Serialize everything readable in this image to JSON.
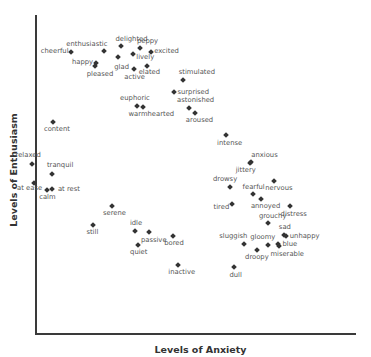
{
  "chart_data": {
    "type": "scatter",
    "title": "",
    "xlabel": "Levels of Anxiety",
    "ylabel": "Levels of Enthusiasm",
    "xlim": [
      0,
      100
    ],
    "ylim": [
      0,
      100
    ],
    "grid": false,
    "legend": null,
    "tick_labels": {
      "x": [],
      "y": []
    },
    "marker": {
      "shape": "diamond",
      "color": "#333333"
    },
    "label_color": "#555555",
    "points": [
      {
        "label": "delighted",
        "x": 26.5,
        "y": 90.2,
        "lx": -5,
        "ly": -10
      },
      {
        "label": "peppy",
        "x": 32.6,
        "y": 89.5,
        "lx": -3,
        "ly": -10
      },
      {
        "label": "enthusiastic",
        "x": 21.4,
        "y": 88.7,
        "lx": -38,
        "ly": -10
      },
      {
        "label": "cheerful",
        "x": 10.9,
        "y": 88.4,
        "lx": -30,
        "ly": -4
      },
      {
        "label": "excited",
        "x": 36.1,
        "y": 88.4,
        "lx": 3,
        "ly": -4
      },
      {
        "label": "lively",
        "x": 30.5,
        "y": 87.8,
        "lx": 3,
        "ly": 0
      },
      {
        "label": "glad",
        "x": 25.8,
        "y": 86.9,
        "lx": -4,
        "ly": 7
      },
      {
        "label": "happy",
        "x": 18.8,
        "y": 84.9,
        "lx": -24,
        "ly": -4
      },
      {
        "label": "pleased",
        "x": 18.4,
        "y": 83.9,
        "lx": -8,
        "ly": 5
      },
      {
        "label": "active",
        "x": 30.8,
        "y": 83.1,
        "lx": -10,
        "ly": 5
      },
      {
        "label": "elated",
        "x": 34.7,
        "y": 84.0,
        "lx": -8,
        "ly": 3
      },
      {
        "label": "stimulated",
        "x": 46.0,
        "y": 79.5,
        "lx": -4,
        "ly": -11
      },
      {
        "label": "surprised",
        "x": 43.4,
        "y": 75.8,
        "lx": 3,
        "ly": -3
      },
      {
        "label": "euphoric",
        "x": 31.7,
        "y": 71.5,
        "lx": -17,
        "ly": -11
      },
      {
        "label": "warmhearted",
        "x": 33.4,
        "y": 71.3,
        "lx": -14,
        "ly": 4
      },
      {
        "label": "astonished",
        "x": 48.0,
        "y": 70.8,
        "lx": -12,
        "ly": -11
      },
      {
        "label": "aroused",
        "x": 49.8,
        "y": 69.4,
        "lx": -9,
        "ly": 4
      },
      {
        "label": "content",
        "x": 5.3,
        "y": 66.6,
        "lx": -9,
        "ly": 4
      },
      {
        "label": "intense",
        "x": 59.6,
        "y": 62.5,
        "lx": -9,
        "ly": 5
      },
      {
        "label": "relaxed",
        "x": -1.4,
        "y": 53.4,
        "lx": -16,
        "ly": -12
      },
      {
        "label": "anxious",
        "x": 67.5,
        "y": 53.8,
        "lx": 0,
        "ly": -10
      },
      {
        "label": "jittery",
        "x": 67.0,
        "y": 53.6,
        "lx": -14,
        "ly": 4
      },
      {
        "label": "tranquil",
        "x": 5.0,
        "y": 50.2,
        "lx": -5,
        "ly": -12
      },
      {
        "label": "nervous",
        "x": 74.7,
        "y": 48.0,
        "lx": -9,
        "ly": 4
      },
      {
        "label": "at ease",
        "x": -0.6,
        "y": 47.3,
        "lx": -17,
        "ly": 2
      },
      {
        "label": "drowsy",
        "x": 60.8,
        "y": 46.0,
        "lx": -17,
        "ly": -11
      },
      {
        "label": "at rest",
        "x": 5.0,
        "y": 45.3,
        "lx": 6,
        "ly": -3
      },
      {
        "label": "calm",
        "x": 3.5,
        "y": 45.2,
        "lx": -8,
        "ly": 4
      },
      {
        "label": "fearful",
        "x": 67.9,
        "y": 43.9,
        "lx": -10,
        "ly": -10
      },
      {
        "label": "annoyed",
        "x": 70.5,
        "y": 42.4,
        "lx": -10,
        "ly": 4
      },
      {
        "label": "tired",
        "x": 61.3,
        "y": 40.9,
        "lx": -18,
        "ly": 0
      },
      {
        "label": "distress",
        "x": 79.5,
        "y": 40.1,
        "lx": -9,
        "ly": 5
      },
      {
        "label": "serene",
        "x": 23.8,
        "y": 40.1,
        "lx": -9,
        "ly": 4
      },
      {
        "label": "grouchy",
        "x": 72.7,
        "y": 34.9,
        "lx": -9,
        "ly": -10
      },
      {
        "label": "still",
        "x": 18.0,
        "y": 34.2,
        "lx": -7,
        "ly": 4
      },
      {
        "label": "idle",
        "x": 31.0,
        "y": 32.2,
        "lx": -5,
        "ly": -11
      },
      {
        "label": "passive",
        "x": 35.4,
        "y": 32.1,
        "lx": -8,
        "ly": 5
      },
      {
        "label": "sad",
        "x": 77.7,
        "y": 31.0,
        "lx": -5,
        "ly": -11
      },
      {
        "label": "unhappy",
        "x": 78.3,
        "y": 30.6,
        "lx": 4,
        "ly": -3
      },
      {
        "label": "bored",
        "x": 43.0,
        "y": 30.7,
        "lx": -9,
        "ly": 4
      },
      {
        "label": "sluggish",
        "x": 65.3,
        "y": 28.3,
        "lx": -25,
        "ly": -11
      },
      {
        "label": "gloomy",
        "x": 72.8,
        "y": 28.0,
        "lx": -18,
        "ly": -11
      },
      {
        "label": "blue",
        "x": 76.0,
        "y": 28.2,
        "lx": 4,
        "ly": -3
      },
      {
        "label": "miserable",
        "x": 76.3,
        "y": 27.6,
        "lx": -9,
        "ly": 5
      },
      {
        "label": "quiet",
        "x": 32.0,
        "y": 27.9,
        "lx": -8,
        "ly": 4
      },
      {
        "label": "droopy",
        "x": 69.3,
        "y": 26.2,
        "lx": -12,
        "ly": 4
      },
      {
        "label": "inactive",
        "x": 44.6,
        "y": 21.6,
        "lx": -10,
        "ly": 4
      },
      {
        "label": "dull",
        "x": 62.2,
        "y": 20.9,
        "lx": -5,
        "ly": 5
      }
    ]
  },
  "axes": {
    "x_title": "Levels of Anxiety",
    "y_title": "Levels of Enthusiasm"
  }
}
